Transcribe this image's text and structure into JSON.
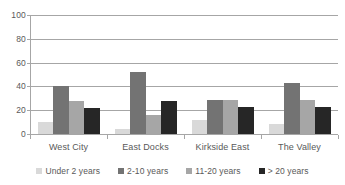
{
  "chart_data": {
    "type": "bar",
    "title": "",
    "subtitle": "",
    "xlabel": "",
    "ylabel": "",
    "categories": [
      "West City",
      "East Docks",
      "Kirkside East",
      "The Valley"
    ],
    "series": [
      {
        "name": "Under 2 years",
        "color": "#d9d9d9",
        "values": [
          10,
          4,
          12,
          8.5
        ]
      },
      {
        "name": "2-10 years",
        "color": "#737373",
        "values": [
          40,
          52,
          28.5,
          42.5
        ]
      },
      {
        "name": "11-20 years",
        "color": "#a6a6a6",
        "values": [
          28,
          16,
          28.5,
          29
        ]
      },
      {
        "name": "> 20 years",
        "color": "#262626",
        "values": [
          22,
          28,
          22.5,
          23
        ]
      }
    ],
    "ylim": [
      0,
      100
    ],
    "yticks": [
      0,
      20,
      40,
      60,
      80,
      100
    ],
    "ytick_labels": [
      "0",
      "20",
      "40",
      "60",
      "80",
      "100"
    ],
    "grid": true,
    "grid_axis": "y",
    "legend_position": "bottom",
    "axis_color": "#a6a6a6",
    "text_color": "#595959",
    "background_color": "#ffffff"
  }
}
